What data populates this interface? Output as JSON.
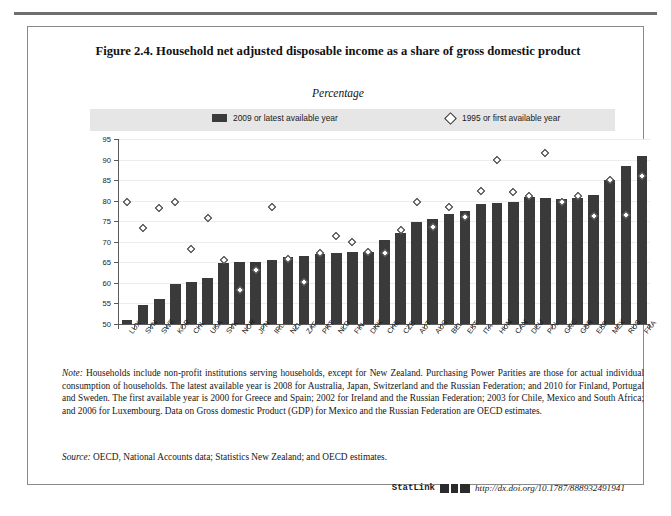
{
  "figure": {
    "title": "Figure 2.4. Household net adjusted disposable income as a share of gross domestic product",
    "subtitle": "Percentage",
    "note_label": "Note:",
    "note_text": " Households include non-profit institutions serving households, except for New Zealand. Purchasing Power Parities are those for actual individual consumption of households. The latest available year is 2008 for Australia, Japan, Switzerland and the Russian Federation; and 2010 for Finland, Portugal and Sweden. The first available year is 2000 for Greece and Spain; 2002 for Ireland and the Russian Federation; 2003 for Chile, Mexico and South Africa; and 2006 for Luxembourg. Data on Gross domestic Product (GDP) for Mexico and the Russian Federation are OECD estimates.",
    "source_label": "Source:",
    "source_text": " OECD, National Accounts data; Statistics New Zealand; and OECD estimates.",
    "statlink_label": "StatLink",
    "statlink_url": "http://dx.doi.org/10.1787/888932491941"
  },
  "chart_data": {
    "type": "bar",
    "title": "Figure 2.4. Household net adjusted disposable income as a share of gross domestic product",
    "subtitle": "Percentage",
    "xlabel": "",
    "ylabel": "",
    "ylim": [
      50,
      95
    ],
    "yticks": [
      50,
      55,
      60,
      65,
      70,
      75,
      80,
      85,
      90,
      95
    ],
    "grid": true,
    "legend_position": "top",
    "categories": [
      "LUX",
      "SVN",
      "SWE",
      "KOR",
      "CHL",
      "USA",
      "SVK",
      "NOR",
      "JPN",
      "IRL",
      "NZL",
      "ZAF",
      "PRT",
      "NLD",
      "FIN",
      "DNK",
      "CHE",
      "CZE",
      "AUT",
      "AUS",
      "BEL",
      "EST",
      "ITA",
      "HUN",
      "CAN",
      "DEU",
      "POL",
      "GRC",
      "GBR",
      "ESP",
      "MEX",
      "RUS",
      "FRA"
    ],
    "series": [
      {
        "name": "2009 or latest available year",
        "type": "bar",
        "color": "#3a3a3a",
        "values": [
          51.0,
          54.6,
          56.0,
          59.8,
          60.1,
          61.2,
          64.8,
          65.2,
          65.0,
          65.6,
          66.4,
          66.5,
          67.0,
          67.3,
          67.4,
          67.6,
          70.5,
          72.1,
          74.8,
          75.5,
          76.8,
          77.5,
          79.1,
          79.4,
          79.7,
          80.8,
          80.6,
          80.5,
          80.6,
          81.3,
          85.0,
          88.5,
          90.8
        ]
      },
      {
        "name": "1995 or first available year",
        "type": "scatter",
        "marker": "diamond",
        "color": "#2e2e2e",
        "values": [
          79.8,
          73.4,
          78.3,
          79.7,
          68.2,
          75.7,
          65.5,
          58.2,
          63.1,
          78.4,
          65.9,
          60.3,
          67.3,
          71.4,
          69.9,
          67.5,
          67.3,
          72.8,
          79.7,
          73.5,
          78.5,
          76.0,
          82.4,
          90.0,
          82.0,
          81.1,
          91.5,
          79.8,
          81.2,
          76.2,
          85.0,
          76.5,
          86.0
        ]
      }
    ],
    "legend": [
      "2009 or latest available year",
      "1995 or first available year"
    ]
  }
}
